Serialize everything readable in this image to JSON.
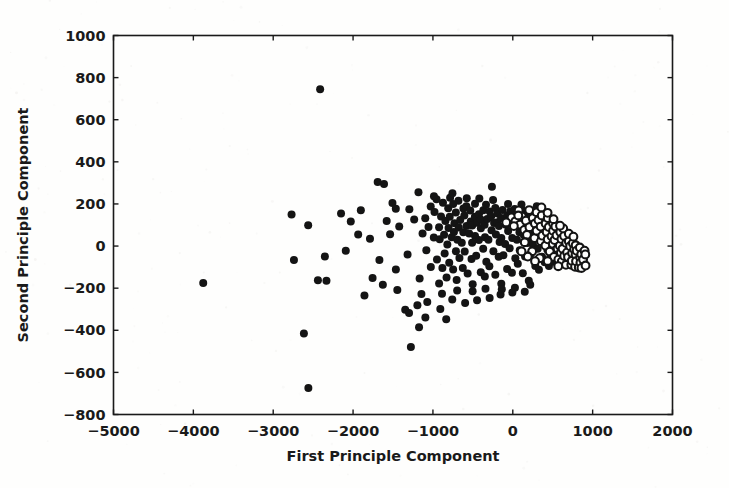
{
  "figure": {
    "background_color": "#fefefd",
    "foreground_color": "#141414",
    "width": 729,
    "height": 488
  },
  "chart_data": {
    "type": "scatter",
    "title": "",
    "xlabel": "First Principle Component",
    "ylabel": "Second Principle Component",
    "xlim": [
      -5000,
      2000
    ],
    "ylim": [
      -800,
      1000
    ],
    "xticks": [
      -5000,
      -4000,
      -3000,
      -2000,
      -1000,
      0,
      1000,
      2000
    ],
    "xtick_labels": [
      "−5000",
      "−4000",
      "−3000",
      "−2000",
      "−1000",
      "0",
      "1000",
      "2000"
    ],
    "yticks": [
      -800,
      -600,
      -400,
      -200,
      0,
      200,
      400,
      600,
      800,
      1000
    ],
    "ytick_labels": [
      "−800",
      "−600",
      "−400",
      "−200",
      "0",
      "200",
      "400",
      "600",
      "800",
      "1000"
    ],
    "grid": false,
    "legend": null,
    "tick_direction": "in",
    "frame": "full-box",
    "marker_size_px": 9,
    "series": [
      {
        "name": "group-filled",
        "marker": "filled-circle",
        "color": "#141414",
        "points": [
          [
            -3870,
            -175
          ],
          [
            -2400,
            740
          ],
          [
            -2570,
            -675
          ],
          [
            -2610,
            -420
          ],
          [
            -2770,
            150
          ],
          [
            -2740,
            -70
          ],
          [
            -2450,
            -165
          ],
          [
            -2330,
            -160
          ],
          [
            -2340,
            -45
          ],
          [
            -2140,
            155
          ],
          [
            -2020,
            120
          ],
          [
            -1930,
            60
          ],
          [
            -1690,
            300
          ],
          [
            -1610,
            295
          ],
          [
            -1590,
            115
          ],
          [
            -1540,
            60
          ],
          [
            -1470,
            -110
          ],
          [
            -1440,
            -205
          ],
          [
            -1350,
            -300
          ],
          [
            -1290,
            -320
          ],
          [
            -1270,
            -480
          ],
          [
            -1200,
            -285
          ],
          [
            -1190,
            255
          ],
          [
            -1160,
            -150
          ],
          [
            -1130,
            60
          ],
          [
            -1100,
            130
          ],
          [
            -1090,
            -20
          ],
          [
            -1060,
            95
          ],
          [
            -1040,
            185
          ],
          [
            -1030,
            -95
          ],
          [
            -1000,
            40
          ],
          [
            -980,
            160
          ],
          [
            -960,
            -60
          ],
          [
            -950,
            220
          ],
          [
            -930,
            90
          ],
          [
            -920,
            -175
          ],
          [
            -910,
            30
          ],
          [
            -900,
            145
          ],
          [
            -880,
            -105
          ],
          [
            -870,
            205
          ],
          [
            -860,
            55
          ],
          [
            -850,
            -35
          ],
          [
            -840,
            120
          ],
          [
            -830,
            -150
          ],
          [
            -820,
            175
          ],
          [
            -810,
            10
          ],
          [
            -800,
            85
          ],
          [
            -790,
            -75
          ],
          [
            -780,
            140
          ],
          [
            -770,
            45
          ],
          [
            -760,
            195
          ],
          [
            -750,
            -115
          ],
          [
            -740,
            65
          ],
          [
            -730,
            110
          ],
          [
            -720,
            -20
          ],
          [
            -710,
            160
          ],
          [
            -700,
            35
          ],
          [
            -690,
            -160
          ],
          [
            -680,
            90
          ],
          [
            -670,
            215
          ],
          [
            -660,
            -55
          ],
          [
            -650,
            125
          ],
          [
            -640,
            20
          ],
          [
            -630,
            175
          ],
          [
            -620,
            -100
          ],
          [
            -610,
            70
          ],
          [
            -600,
            145
          ],
          [
            -590,
            -30
          ],
          [
            -580,
            100
          ],
          [
            -570,
            190
          ],
          [
            -560,
            -135
          ],
          [
            -550,
            55
          ],
          [
            -540,
            120
          ],
          [
            -530,
            -65
          ],
          [
            -520,
            165
          ],
          [
            -510,
            15
          ],
          [
            -500,
            95
          ],
          [
            -490,
            -185
          ],
          [
            -480,
            135
          ],
          [
            -470,
            50
          ],
          [
            -460,
            205
          ],
          [
            -450,
            -45
          ],
          [
            -440,
            110
          ],
          [
            -430,
            25
          ],
          [
            -420,
            155
          ],
          [
            -410,
            -120
          ],
          [
            -400,
            80
          ],
          [
            -390,
            130
          ],
          [
            -380,
            -10
          ],
          [
            -370,
            170
          ],
          [
            -360,
            45
          ],
          [
            -350,
            -150
          ],
          [
            -340,
            100
          ],
          [
            -330,
            195
          ],
          [
            -320,
            -70
          ],
          [
            -310,
            125
          ],
          [
            -300,
            30
          ],
          [
            -290,
            160
          ],
          [
            -280,
            -95
          ],
          [
            -270,
            75
          ],
          [
            -260,
            140
          ],
          [
            -250,
            -25
          ],
          [
            -240,
            105
          ],
          [
            -230,
            185
          ],
          [
            -220,
            -140
          ],
          [
            -210,
            60
          ],
          [
            -200,
            115
          ],
          [
            -190,
            -55
          ],
          [
            -180,
            150
          ],
          [
            -170,
            20
          ],
          [
            -160,
            90
          ],
          [
            -150,
            -175
          ],
          [
            -140,
            130
          ],
          [
            -130,
            40
          ],
          [
            -120,
            175
          ],
          [
            -110,
            -40
          ],
          [
            -100,
            105
          ],
          [
            -90,
            15
          ],
          [
            -80,
            145
          ],
          [
            -70,
            -110
          ],
          [
            -60,
            70
          ],
          [
            -50,
            120
          ],
          [
            -40,
            -15
          ],
          [
            -30,
            160
          ],
          [
            -20,
            35
          ],
          [
            -10,
            -130
          ],
          [
            0,
            95
          ],
          [
            10,
            175
          ],
          [
            20,
            -60
          ],
          [
            30,
            115
          ],
          [
            40,
            25
          ],
          [
            50,
            150
          ],
          [
            60,
            -85
          ],
          [
            70,
            65
          ],
          [
            80,
            130
          ],
          [
            90,
            -20
          ],
          [
            100,
            100
          ],
          [
            110,
            170
          ],
          [
            120,
            -125
          ],
          [
            130,
            55
          ],
          [
            140,
            110
          ],
          [
            150,
            -45
          ],
          [
            160,
            140
          ],
          [
            170,
            15
          ],
          [
            180,
            85
          ],
          [
            190,
            -160
          ],
          [
            200,
            120
          ],
          [
            210,
            35
          ],
          [
            220,
            165
          ],
          [
            230,
            -35
          ],
          [
            240,
            95
          ],
          [
            250,
            10
          ],
          [
            260,
            135
          ],
          [
            270,
            -100
          ],
          [
            280,
            60
          ],
          [
            290,
            110
          ],
          [
            300,
            -10
          ],
          [
            310,
            150
          ],
          [
            320,
            30
          ],
          [
            330,
            -115
          ],
          [
            340,
            85
          ],
          [
            350,
            160
          ],
          [
            360,
            -55
          ],
          [
            370,
            105
          ],
          [
            380,
            20
          ],
          [
            390,
            140
          ],
          [
            400,
            -75
          ],
          [
            410,
            55
          ],
          [
            420,
            120
          ],
          [
            430,
            -15
          ],
          [
            440,
            90
          ],
          [
            450,
            -95
          ],
          [
            460,
            45
          ],
          [
            470,
            115
          ],
          [
            480,
            -40
          ],
          [
            490,
            75
          ],
          [
            500,
            20
          ],
          [
            510,
            -70
          ],
          [
            520,
            95
          ],
          [
            530,
            -20
          ],
          [
            540,
            55
          ],
          [
            550,
            -50
          ],
          [
            560,
            70
          ],
          [
            -1850,
            -240
          ],
          [
            -1750,
            -155
          ],
          [
            -1660,
            -70
          ],
          [
            -1520,
            200
          ],
          [
            -1410,
            90
          ],
          [
            -1330,
            -40
          ],
          [
            -1240,
            130
          ],
          [
            -1150,
            -225
          ],
          [
            -1070,
            -265
          ],
          [
            -990,
            240
          ],
          [
            -890,
            -230
          ],
          [
            -790,
            230
          ],
          [
            -690,
            -215
          ],
          [
            -590,
            230
          ],
          [
            -500,
            -210
          ],
          [
            -420,
            225
          ],
          [
            -330,
            -200
          ],
          [
            -240,
            215
          ],
          [
            -150,
            -205
          ],
          [
            -60,
            205
          ],
          [
            30,
            -195
          ],
          [
            120,
            200
          ],
          [
            210,
            -185
          ],
          [
            300,
            190
          ],
          [
            -2550,
            95
          ],
          [
            -2100,
            -20
          ],
          [
            -1900,
            175
          ],
          [
            -1780,
            35
          ],
          [
            -1630,
            -185
          ],
          [
            -1460,
            180
          ],
          [
            -1300,
            175
          ],
          [
            -1100,
            -340
          ],
          [
            -900,
            -300
          ],
          [
            -750,
            -250
          ],
          [
            -600,
            -270
          ],
          [
            -450,
            -255
          ],
          [
            -300,
            -245
          ],
          [
            -150,
            -235
          ],
          [
            0,
            -225
          ],
          [
            150,
            -220
          ],
          [
            -260,
            280
          ],
          [
            -760,
            250
          ],
          [
            -1180,
            -390
          ],
          [
            -820,
            -345
          ]
        ]
      },
      {
        "name": "group-open",
        "marker": "open-circle",
        "color": "#141414",
        "points": [
          [
            -20,
            140
          ],
          [
            40,
            120
          ],
          [
            60,
            165
          ],
          [
            100,
            100
          ],
          [
            120,
            145
          ],
          [
            150,
            75
          ],
          [
            170,
            125
          ],
          [
            190,
            55
          ],
          [
            200,
            170
          ],
          [
            220,
            95
          ],
          [
            240,
            135
          ],
          [
            260,
            40
          ],
          [
            270,
            110
          ],
          [
            290,
            160
          ],
          [
            300,
            70
          ],
          [
            320,
            120
          ],
          [
            340,
            20
          ],
          [
            350,
            90
          ],
          [
            360,
            145
          ],
          [
            380,
            50
          ],
          [
            400,
            105
          ],
          [
            410,
            0
          ],
          [
            420,
            65
          ],
          [
            430,
            130
          ],
          [
            450,
            30
          ],
          [
            460,
            90
          ],
          [
            470,
            -30
          ],
          [
            480,
            45
          ],
          [
            490,
            110
          ],
          [
            500,
            10
          ],
          [
            510,
            70
          ],
          [
            520,
            -50
          ],
          [
            530,
            25
          ],
          [
            540,
            90
          ],
          [
            550,
            -10
          ],
          [
            560,
            50
          ],
          [
            570,
            -65
          ],
          [
            580,
            5
          ],
          [
            590,
            65
          ],
          [
            600,
            -30
          ],
          [
            610,
            30
          ],
          [
            620,
            -75
          ],
          [
            630,
            -15
          ],
          [
            640,
            45
          ],
          [
            650,
            -45
          ],
          [
            660,
            10
          ],
          [
            670,
            -85
          ],
          [
            680,
            -25
          ],
          [
            690,
            25
          ],
          [
            700,
            -55
          ],
          [
            710,
            -5
          ],
          [
            720,
            -90
          ],
          [
            730,
            -35
          ],
          [
            740,
            10
          ],
          [
            750,
            -65
          ],
          [
            760,
            -15
          ],
          [
            770,
            -95
          ],
          [
            780,
            -45
          ],
          [
            790,
            0
          ],
          [
            800,
            -70
          ],
          [
            810,
            -25
          ],
          [
            820,
            -100
          ],
          [
            830,
            -55
          ],
          [
            840,
            -10
          ],
          [
            850,
            -80
          ],
          [
            860,
            -35
          ],
          [
            870,
            -105
          ],
          [
            880,
            -60
          ],
          [
            890,
            -20
          ],
          [
            900,
            -90
          ],
          [
            910,
            -45
          ],
          [
            -80,
            115
          ],
          [
            0,
            95
          ],
          [
            80,
            150
          ],
          [
            160,
            20
          ],
          [
            250,
            -20
          ],
          [
            330,
            -55
          ],
          [
            440,
            -75
          ],
          [
            560,
            -95
          ],
          [
            620,
            80
          ],
          [
            690,
            60
          ],
          [
            750,
            40
          ],
          [
            360,
            180
          ],
          [
            430,
            160
          ],
          [
            280,
            -70
          ],
          [
            200,
            -45
          ],
          [
            120,
            -25
          ],
          [
            520,
            125
          ],
          [
            600,
            100
          ]
        ]
      }
    ]
  }
}
